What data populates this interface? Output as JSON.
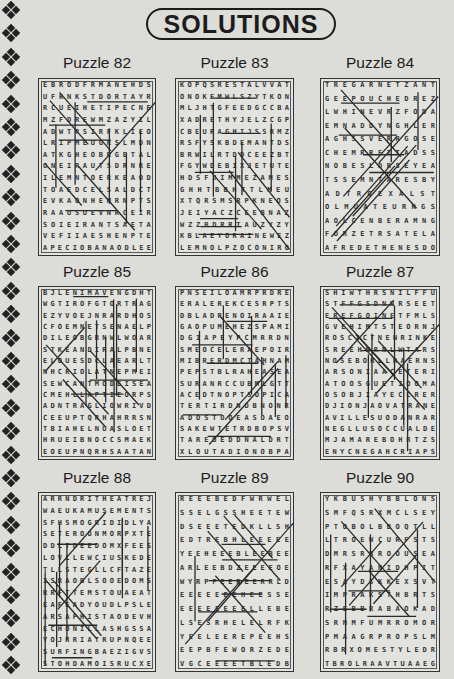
{
  "header": {
    "title": "SOLUTIONS"
  },
  "decoration": {
    "border_icon": "four-diamond-ornament",
    "count": 29
  },
  "puzzles": [
    {
      "label": "Puzzle 82",
      "rows": [
        "EBRODFRMANEHDS",
        "UFRNKSTDORTAYR",
        "RCUEIHETIPECNE",
        "MZFDREWMZAZYIL",
        "ADWTRSIRFKLIEO",
        "LRIPMEUGRSLMDN",
        "ATKGHEOBRGETAL",
        "ONEIRAUTSDRNRE",
        "ILEMNTOERKEAOD",
        "TOAEDCELSALDCT",
        "EVKAONHEMRNPTS",
        "RAAUSUEVNRCEIR",
        "SOIEIRANTSAETA",
        "VEFIIAESHENPTE",
        "APECIOBANAODLEE"
      ]
    },
    {
      "label": "Puzzle 85",
      "rows": [
        "BJLENIMAVENGDHT",
        "WGTIROFGTORTRAG",
        "EZYVOEJNRARDHOS",
        "CFOEMNETSENAELP",
        "DILEOBGRNWLWOAR",
        "STKEANDIRALPBNE",
        "ELOUESDCLAEARLT",
        "NHCRIOLATNEPMEI",
        "SEWCANTMODEISEA",
        "CMEHLLAPTIEORPS",
        "ADNTRAGLIOWRIVD",
        "CEEUPTQRHAHRRSN",
        "TBIAHELNUASLOET",
        "HRUEIBNOCCSMAEK",
        "EOEUPNQRHSAATAN"
      ]
    },
    {
      "label": "Puzzle 88",
      "rows": [
        "ARRNDRITHEATREJ",
        "WAEUKAMUSEMENTS",
        "SFHSMOGRIDIDLYA",
        "SETEROONMORPXTE",
        "DDLTDEEDOMXFEES",
        "LOVLLEWCIUSKEDE",
        "TLLSTEGLLCFTAZE",
        "ISRAOBLSOOEDOMS",
        "RRFTTEMSTOUAEAT",
        "EAFEADYOUDLPSLE",
        "ARSAPHISTAODEVH",
        "ECHONILLASHGSSA",
        "YOJRRIATRUPNQEE",
        "SURFINGBAEZIGVS",
        "STOHDAMOISRUCXE"
      ]
    },
    {
      "label": "Puzzle 83",
      "rows": [
        "KOPQSRESTALVVAT",
        "ONOKFMWLSZYTKON",
        "MLJHTGFEEDGCCBA",
        "XADRETHYJELZCGP",
        "CBEURAGHIJSSRMZ",
        "RSFYSKBDEMANTDS",
        "BRWILRTDDCEEZBT",
        "FGYWDEBIXJETUTE",
        "HDSFJIMMEZAMES",
        "GHHTBBHTTLMEU",
        "XTQRSMSRPKNEOS",
        "JEIYACZCEEBNAZ",
        "WZZBDRRTAUZYZY",
        "KBLAEYORAINEWEZ",
        "LEMNOLPZOCONIRO"
      ]
    },
    {
      "label": "Puzzle 86",
      "rows": [
        "PNSEILOAMRPRDRE",
        "ERALEREKCESRPTS",
        "DBLADRENOIRAAIE",
        "GAOPUMEHEZSPAMI",
        "DGIAPEYPCMRRDN",
        "SMEOCELERAEPOIR",
        "MIBRERDMCTAHNAM",
        "PEPSTBLRAHEASEA",
        "SURANRCCUBMLGTT",
        "ACEDTNOPTSOPICA",
        "TERTIRDNDBNONR",
        "ADOSTOOEASOAEO",
        "SAKEWTETRDBOPSV",
        "TAREOEDDNALDRT",
        "XLOUTADIONOBPA"
      ]
    },
    {
      "label": "Puzzle 89",
      "rows": [
        "REEEBEDFWRWEL",
        "SSELGSSHEETEW",
        "DSEEETEDKLLSH",
        "EDTREBHLEEEEE",
        "YEEHEEEBLEEBEE",
        "ARLEEBDZEEEEOE",
        "WYRPFEEREERRLD",
        "EEEEEEEHEESSE",
        "EEEEEEEELLEBE",
        "LSESRHELELRFK",
        "YEELEEREPEEHS",
        "EEPBFEWORZEDE",
        "VGCEEEETBLEDB"
      ]
    },
    {
      "label": "Puzzle 84",
      "rows": [
        "TREGARNETZANT",
        "GEEPOUCHEDREZ",
        "LWHINEVRZFODA",
        "EMNADDYNGHLER",
        "AGHSSVERRGOSE",
        "CHEMRRETTADSS",
        "NOBESLDRSEYEA",
        "TSSEMNTARESBY",
        "ADTRGEXALST",
        "OLMUATEURRGS",
        "AOLCENBERAMNG",
        "FORZETRSATELA",
        "AFREDETHENESDO"
      ]
    },
    {
      "label": "Puzzle 87",
      "rows": [
        "SHIWTHRSNILFFU",
        "STFFGSDNNRSEET",
        "EREFGOINETFMLS",
        "GVEHIMTSTEORNJ",
        "ROSCICTNENRINKE",
        "SREEHNRNLWTARS",
        "NOSEBORLLRAERNS",
        "ARSONIAACETERI",
        "ATOOSGUETIOOMA",
        "OSOBJIAYECCRER",
        "DJIONJAOVATRANE",
        "AVILLESUODANRAR",
        "NEGLLUSOCCUALDE",
        "MJAMAREBOHRTZS",
        "ENYCNEGAHCRIAPS"
      ]
    },
    {
      "label": "Puzzle 90",
      "rows": [
        "YKBUSHYBBLONS",
        "SMFQSRXMCLSEY",
        "PTOBOLBBOQTLL",
        "LTROEWCURFSTS",
        "DMRSRBROOUSEA",
        "RFXAYANIDHPIT",
        "ESAYDSKKEXSVT",
        "IMPRAKSTHBRTS",
        "RZEBBRABAOKAD",
        "SRNMFUMRROMOR",
        "PMAAGRPROPSLM",
        "RBRXOMESTYLEDR",
        "TBROLRAAVTUAAEG"
      ]
    }
  ]
}
